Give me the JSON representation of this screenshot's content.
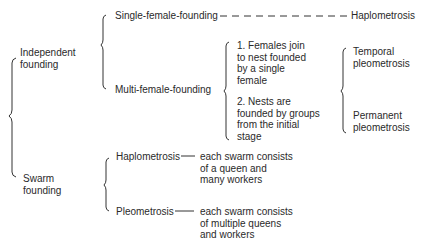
{
  "diagram": {
    "root_branches": [
      {
        "label": "Independent\nfounding",
        "children": [
          {
            "label": "Single-female-founding",
            "result": "Haplometrosis",
            "connector": "dashed"
          },
          {
            "label": "Multi-female-founding",
            "modes": [
              "1. Females join\nto nest founded\nby a single\nfemale",
              "2. Nests are\nfounded by groups\nfrom the initial\nstage"
            ],
            "results": [
              "Temporal\npleometrosis",
              "Permanent\npleometrosis"
            ]
          }
        ]
      },
      {
        "label": "Swarm\nfounding",
        "children": [
          {
            "label": "Haplometrosis",
            "description": "each swarm consists\nof a queen and\nmany workers",
            "connector": "solid"
          },
          {
            "label": "Pleometrosis",
            "description": "each swarm consists\nof multiple queens\nand workers",
            "connector": "solid"
          }
        ]
      }
    ]
  }
}
